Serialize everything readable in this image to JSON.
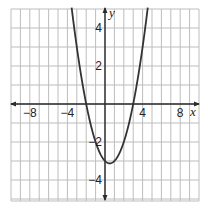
{
  "chart_data": {
    "type": "line",
    "title": "",
    "xlabel": "x",
    "ylabel": "y",
    "xlim": [
      -10,
      10
    ],
    "ylim": [
      -5,
      5
    ],
    "grid": true,
    "grid_step": {
      "x": 1,
      "y": 1
    },
    "x_ticks": [
      {
        "value": -8,
        "label": "−8"
      },
      {
        "value": -4,
        "label": "−4"
      },
      {
        "value": 4,
        "label": "4"
      },
      {
        "value": 8,
        "label": "8"
      }
    ],
    "y_ticks": [
      {
        "value": 4,
        "label": "4"
      },
      {
        "value": 2,
        "label": "2"
      },
      {
        "value": -2,
        "label": "−2"
      },
      {
        "value": -4,
        "label": "−4"
      }
    ],
    "series": [
      {
        "name": "parabola",
        "equation": "y = 0.5x^2 - 0.5x - 3",
        "coefficients": {
          "a": 0.5,
          "b": -0.5,
          "c": -3
        },
        "vertex": [
          0.5,
          -3.125
        ],
        "x_intercepts": [
          -2,
          3
        ],
        "y_intercept": -3,
        "color": "#333333"
      }
    ],
    "legend": null
  },
  "colors": {
    "grid": "#bdbdbd",
    "axis": "#2a2a2a",
    "curve": "#333333",
    "background": "#ffffff"
  }
}
